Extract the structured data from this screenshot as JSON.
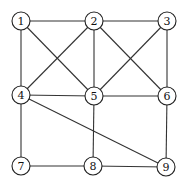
{
  "graph": {
    "node_radius": 9,
    "nodes": [
      {
        "id": "1",
        "label": "1",
        "x": 21,
        "y": 21
      },
      {
        "id": "2",
        "label": "2",
        "x": 94,
        "y": 21
      },
      {
        "id": "3",
        "label": "3",
        "x": 167,
        "y": 21
      },
      {
        "id": "4",
        "label": "4",
        "x": 21,
        "y": 95
      },
      {
        "id": "5",
        "label": "5",
        "x": 94,
        "y": 96
      },
      {
        "id": "6",
        "label": "6",
        "x": 167,
        "y": 96
      },
      {
        "id": "7",
        "label": "7",
        "x": 21,
        "y": 166
      },
      {
        "id": "8",
        "label": "8",
        "x": 93,
        "y": 166
      },
      {
        "id": "9",
        "label": "9",
        "x": 166,
        "y": 167
      }
    ],
    "edges": [
      [
        "1",
        "2"
      ],
      [
        "2",
        "3"
      ],
      [
        "1",
        "4"
      ],
      [
        "1",
        "5"
      ],
      [
        "2",
        "4"
      ],
      [
        "2",
        "5"
      ],
      [
        "2",
        "6"
      ],
      [
        "3",
        "5"
      ],
      [
        "3",
        "6"
      ],
      [
        "4",
        "5"
      ],
      [
        "5",
        "6"
      ],
      [
        "4",
        "7"
      ],
      [
        "4",
        "9"
      ],
      [
        "5",
        "8"
      ],
      [
        "6",
        "9"
      ],
      [
        "7",
        "8"
      ],
      [
        "8",
        "9"
      ]
    ]
  }
}
